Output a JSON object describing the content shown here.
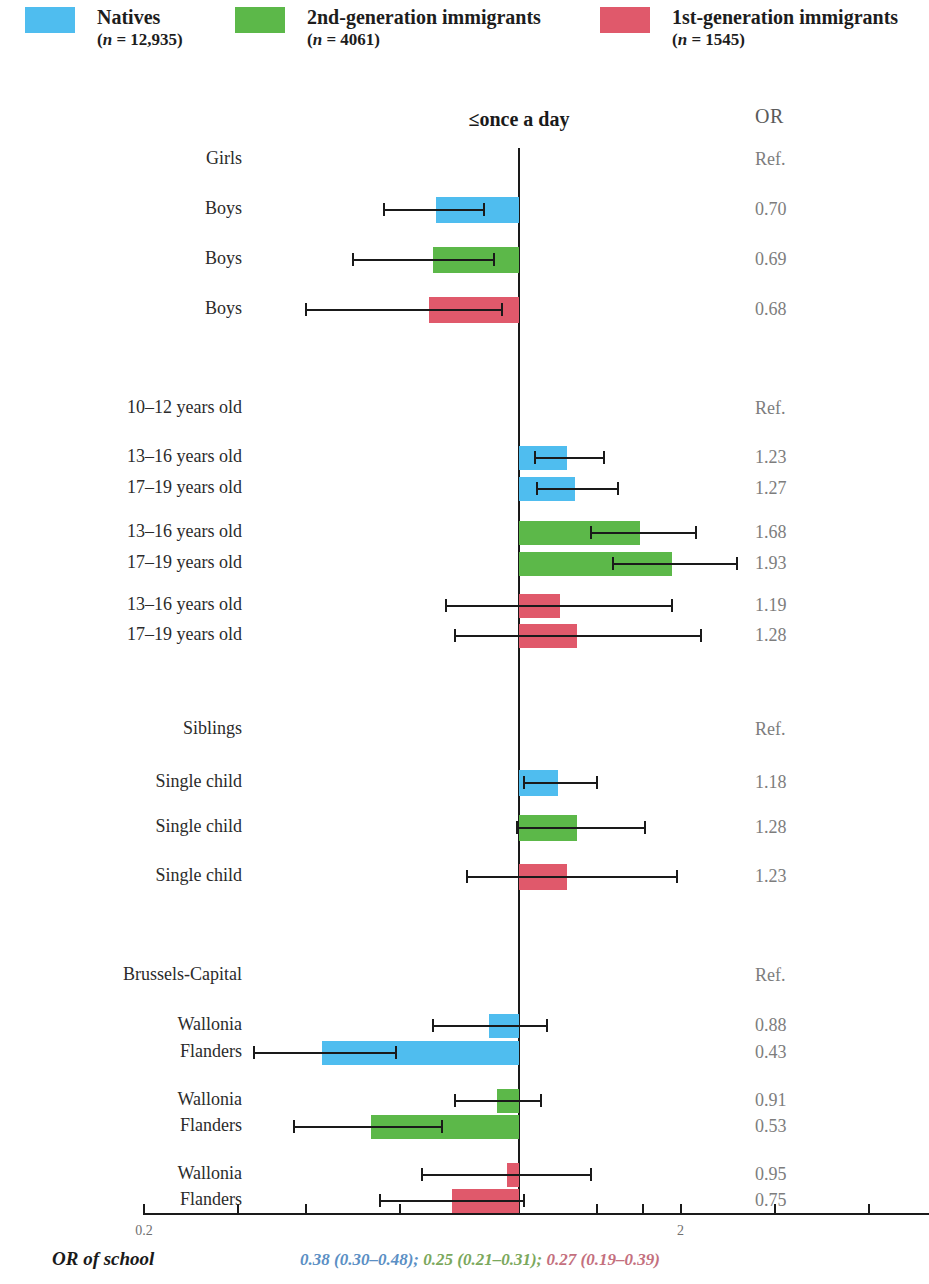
{
  "legend": {
    "items": [
      {
        "label": "Natives",
        "n_text": "(n = 12,935)",
        "color": "#4FBDEF",
        "x": 25
      },
      {
        "label": "2nd-generation immigrants",
        "n_text": "(n = 4061)",
        "color": "#5CB849",
        "x": 235
      },
      {
        "label": "1st-generation immigrants",
        "n_text": "(n = 1545)",
        "color": "#E0596B",
        "x": 600
      }
    ]
  },
  "header": {
    "column_title": "≤once a day",
    "or_header": "OR"
  },
  "axis": {
    "ticks": [
      {
        "value": 0.2,
        "label": "0.2"
      },
      {
        "value": 0.3,
        "label": ""
      },
      {
        "value": 0.4,
        "label": ""
      },
      {
        "value": 0.6,
        "label": ""
      },
      {
        "value": 0.8,
        "label": ""
      },
      {
        "value": 1.0,
        "label": ""
      },
      {
        "value": 1.4,
        "label": ""
      },
      {
        "value": 1.7,
        "label": ""
      },
      {
        "value": 2.0,
        "label": "2"
      },
      {
        "value": 3.0,
        "label": ""
      },
      {
        "value": 4.5,
        "label": ""
      }
    ],
    "scale": "log",
    "xmin": 0.2,
    "xmax": 5.0
  },
  "footer": {
    "label": "OR of school",
    "values": [
      {
        "text": "0.38 (0.30–0.48)",
        "color": "#5B8FC4"
      },
      {
        "text": "0.25 (0.21–0.31)",
        "color": "#7BA85C"
      },
      {
        "text": "0.27 (0.19–0.39)",
        "color": "#C4707E"
      }
    ],
    "separator": "; "
  },
  "chart_data": {
    "type": "bar",
    "title": "≤once a day",
    "xlabel": "",
    "ylabel": "",
    "scale": "log",
    "xlim": [
      0.2,
      5.0
    ],
    "reference_line": 1.0,
    "series_colors": {
      "natives": "#4FBDEF",
      "second_generation": "#5CB849",
      "first_generation": "#E0596B"
    },
    "rows": [
      {
        "label": "Girls",
        "or_text": "Ref.",
        "or": null,
        "ci_low": null,
        "ci_high": null,
        "group": "sex",
        "series": null,
        "y": 160
      },
      {
        "label": "Boys",
        "or_text": "0.70",
        "or": 0.7,
        "ci_low": 0.56,
        "ci_high": 0.86,
        "group": "sex",
        "series": "natives",
        "y": 210
      },
      {
        "label": "Boys",
        "or_text": "0.69",
        "or": 0.69,
        "ci_low": 0.49,
        "ci_high": 0.9,
        "group": "sex",
        "series": "second_generation",
        "y": 260
      },
      {
        "label": "Boys",
        "or_text": "0.68",
        "or": 0.68,
        "ci_low": 0.4,
        "ci_high": 0.93,
        "group": "sex",
        "series": "first_generation",
        "y": 310
      },
      {
        "label": "10–12 years old",
        "or_text": "Ref.",
        "or": null,
        "ci_low": null,
        "ci_high": null,
        "group": "age",
        "series": null,
        "y": 409
      },
      {
        "label": "13–16 years old",
        "or_text": "1.23",
        "or": 1.23,
        "ci_low": 1.07,
        "ci_high": 1.44,
        "group": "age",
        "series": "natives",
        "y": 458
      },
      {
        "label": "17–19 years old",
        "or_text": "1.27",
        "or": 1.27,
        "ci_low": 1.08,
        "ci_high": 1.53,
        "group": "age",
        "series": "natives",
        "y": 489
      },
      {
        "label": "13–16 years old",
        "or_text": "1.68",
        "or": 1.68,
        "ci_low": 1.36,
        "ci_high": 2.14,
        "group": "age",
        "series": "second_generation",
        "y": 533
      },
      {
        "label": "17–19 years old",
        "or_text": "1.93",
        "or": 1.93,
        "ci_low": 1.5,
        "ci_high": 2.55,
        "group": "age",
        "series": "second_generation",
        "y": 564
      },
      {
        "label": "13–16 years old",
        "or_text": "1.19",
        "or": 1.19,
        "ci_low": 0.73,
        "ci_high": 1.93,
        "group": "age",
        "series": "first_generation",
        "y": 606
      },
      {
        "label": "17–19 years old",
        "or_text": "1.28",
        "or": 1.28,
        "ci_low": 0.76,
        "ci_high": 2.18,
        "group": "age",
        "series": "first_generation",
        "y": 636
      },
      {
        "label": "Siblings",
        "or_text": "Ref.",
        "or": null,
        "ci_low": null,
        "ci_high": null,
        "group": "siblings",
        "series": null,
        "y": 730
      },
      {
        "label": "Single child",
        "or_text": "1.18",
        "or": 1.18,
        "ci_low": 1.02,
        "ci_high": 1.4,
        "group": "siblings",
        "series": "natives",
        "y": 783
      },
      {
        "label": "Single child",
        "or_text": "1.28",
        "or": 1.28,
        "ci_low": 0.99,
        "ci_high": 1.72,
        "group": "siblings",
        "series": "second_generation",
        "y": 828
      },
      {
        "label": "Single child",
        "or_text": "1.23",
        "or": 1.23,
        "ci_low": 0.8,
        "ci_high": 1.97,
        "group": "siblings",
        "series": "first_generation",
        "y": 877
      },
      {
        "label": "Brussels-Capital",
        "or_text": "Ref.",
        "or": null,
        "ci_low": null,
        "ci_high": null,
        "group": "region",
        "series": null,
        "y": 976
      },
      {
        "label": "Wallonia",
        "or_text": "0.88",
        "or": 0.88,
        "ci_low": 0.69,
        "ci_high": 1.13,
        "group": "region",
        "series": "natives",
        "y": 1026
      },
      {
        "label": "Flanders",
        "or_text": "0.43",
        "or": 0.43,
        "ci_low": 0.32,
        "ci_high": 0.59,
        "group": "region",
        "series": "natives",
        "y": 1053
      },
      {
        "label": "Wallonia",
        "or_text": "0.91",
        "or": 0.91,
        "ci_low": 0.76,
        "ci_high": 1.1,
        "group": "region",
        "series": "second_generation",
        "y": 1101
      },
      {
        "label": "Flanders",
        "or_text": "0.53",
        "or": 0.53,
        "ci_low": 0.38,
        "ci_high": 0.72,
        "group": "region",
        "series": "second_generation",
        "y": 1127
      },
      {
        "label": "Wallonia",
        "or_text": "0.95",
        "or": 0.95,
        "ci_low": 0.66,
        "ci_high": 1.36,
        "group": "region",
        "series": "first_generation",
        "y": 1175
      },
      {
        "label": "Flanders",
        "or_text": "0.75",
        "or": 0.75,
        "ci_low": 0.55,
        "ci_high": 1.02,
        "group": "region",
        "series": "first_generation",
        "y": 1201
      }
    ]
  }
}
